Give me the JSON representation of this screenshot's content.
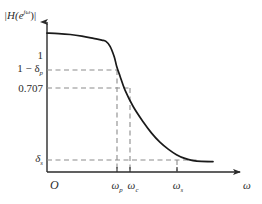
{
  "figure": {
    "kind": "filter-magnitude-response",
    "y_axis_title": "|H(e",
    "y_axis_title_sup": "jω",
    "y_axis_title_tail": ")|",
    "x_axis_title": "ω",
    "origin_label": "O",
    "stroke_color": "#2b2b2b",
    "curve_color": "#1a1a1a",
    "dash_color": "#8c8c8c",
    "background": "#ffffff"
  },
  "y_ticks": [
    {
      "id": "one",
      "label": "1",
      "sub": "",
      "value": 1.0,
      "y_px": 55
    },
    {
      "id": "one_minus_delta_p",
      "label": "1 − δ",
      "sub": "p",
      "value": 0.95,
      "y_px": 70
    },
    {
      "id": "cutoff_0707",
      "label": "0.707",
      "sub": "",
      "value": 0.707,
      "y_px": 88
    },
    {
      "id": "delta_s",
      "label": "δ",
      "sub": "s",
      "value": 0.08,
      "y_px": 160
    }
  ],
  "x_ticks": [
    {
      "id": "omega_p",
      "label": "ω",
      "sub": "p",
      "x_px": 117
    },
    {
      "id": "omega_c",
      "label": "ω",
      "sub": "c",
      "x_px": 130
    },
    {
      "id": "omega_s",
      "label": "ω",
      "sub": "s",
      "x_px": 177
    }
  ],
  "chart_data": {
    "type": "line",
    "title": "",
    "xlabel": "ω",
    "ylabel": "|H(e^{jω})|",
    "grid": false,
    "legend": "none",
    "xlim": [
      0,
      1
    ],
    "ylim": [
      0,
      1.08
    ],
    "annotations": {
      "passband_edge": "ω_p",
      "cutoff_frequency": "ω_c",
      "stopband_edge": "ω_s",
      "passband_ripple": "1 − δ_p",
      "half_power_level": "0.707",
      "stopband_level": "δ_s"
    },
    "series": [
      {
        "name": "|H(e^{jω})|",
        "x": [
          0.0,
          0.07,
          0.14,
          0.21,
          0.28,
          0.33,
          0.355,
          0.38,
          0.405,
          0.42,
          0.44,
          0.47,
          0.52,
          0.58,
          0.63,
          0.68,
          0.73,
          0.78,
          0.83,
          0.88,
          0.93,
          1.0
        ],
        "y": [
          1.0,
          0.997,
          0.99,
          0.978,
          0.962,
          0.95,
          0.94,
          0.905,
          0.83,
          0.76,
          0.69,
          0.59,
          0.47,
          0.36,
          0.28,
          0.215,
          0.165,
          0.125,
          0.098,
          0.082,
          0.076,
          0.075
        ]
      }
    ]
  },
  "guides": {
    "horizontal": [
      {
        "id": "guide-1-minus-dp",
        "y_px": 70,
        "x_from": 47,
        "x_to": 117
      },
      {
        "id": "guide-0707",
        "y_px": 88,
        "x_from": 47,
        "x_to": 130
      },
      {
        "id": "guide-delta-s",
        "y_px": 160,
        "x_from": 47,
        "x_to": 200
      }
    ],
    "vertical": [
      {
        "id": "guide-omega-p",
        "x_px": 117,
        "y_from": 70,
        "y_to": 172
      },
      {
        "id": "guide-omega-c",
        "x_px": 130,
        "y_from": 88,
        "y_to": 172
      },
      {
        "id": "guide-omega-s",
        "x_px": 177,
        "y_from": 160,
        "y_to": 172
      }
    ]
  }
}
